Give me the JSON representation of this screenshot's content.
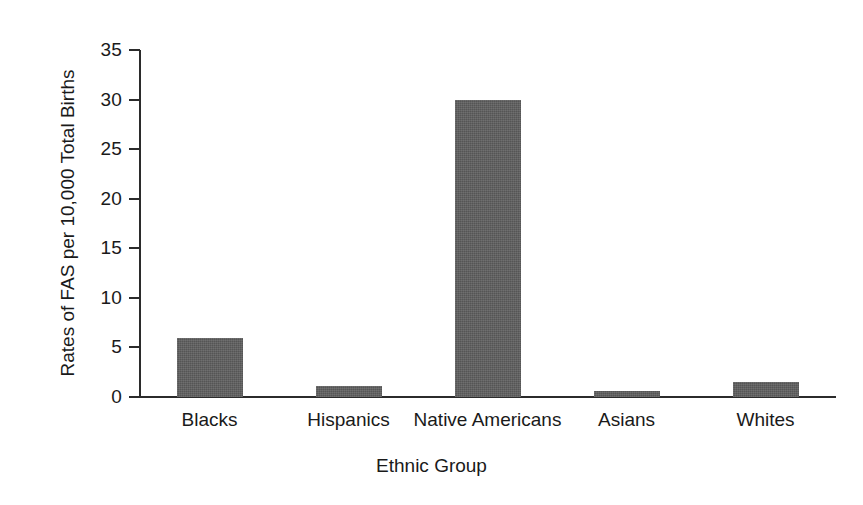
{
  "chart_data": {
    "type": "bar",
    "title": "",
    "subtitle": "",
    "categories": [
      "Blacks",
      "Hispanics",
      "Native Americans",
      "Asians",
      "Whites"
    ],
    "values": [
      6,
      1.1,
      30,
      0.6,
      1.5
    ],
    "xlabel": "Ethnic Group",
    "ylabel": "Rates of FAS per 10,000 Total Births",
    "ylim": [
      0,
      35
    ],
    "yticks": [
      0,
      5,
      10,
      15,
      20,
      25,
      30,
      35
    ],
    "ytick_labels": [
      "0",
      "5",
      "10",
      "15",
      "20",
      "25",
      "30",
      "35"
    ],
    "grid": false,
    "legend": false,
    "legend_position": "none",
    "bar_color": "#5f5f5f",
    "axis_color": "#2b2b2b",
    "background_color": "#ffffff"
  }
}
